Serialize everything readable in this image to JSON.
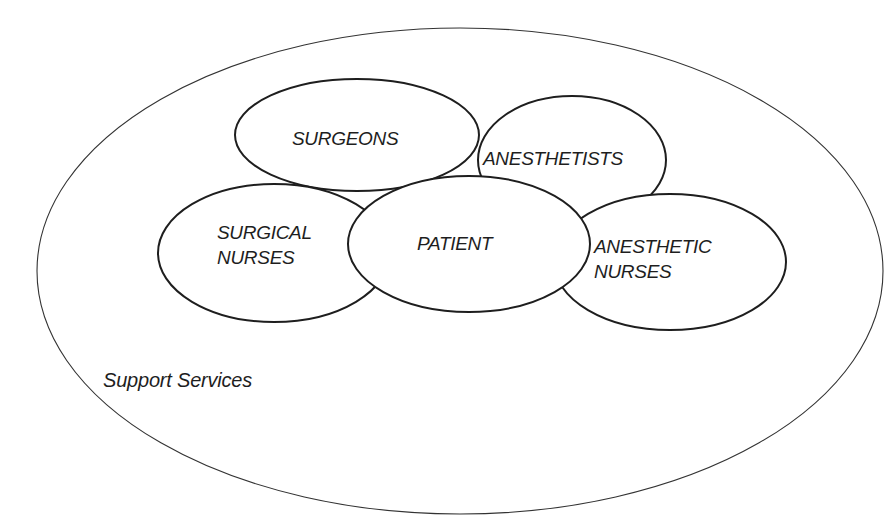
{
  "diagram": {
    "type": "nested-overlapping-ellipses",
    "outer": {
      "label": "Support Services",
      "cx": 460,
      "cy": 271,
      "rx": 423,
      "ry": 243
    },
    "nodes": [
      {
        "id": "surgeons",
        "lines": [
          "SURGEONS"
        ],
        "cx": 357,
        "cy": 135,
        "rx": 122,
        "ry": 56
      },
      {
        "id": "anesthetists",
        "lines": [
          "ANESTHETISTS"
        ],
        "cx": 572,
        "cy": 160,
        "rx": 94,
        "ry": 64
      },
      {
        "id": "surgical-nurses",
        "lines": [
          "SURGICAL",
          "NURSES"
        ],
        "cx": 274,
        "cy": 253,
        "rx": 116,
        "ry": 69
      },
      {
        "id": "anesthetic-nurses",
        "lines": [
          "ANESTHETIC",
          "NURSES"
        ],
        "cx": 670,
        "cy": 262,
        "rx": 116,
        "ry": 68
      },
      {
        "id": "patient",
        "lines": [
          "PATIENT"
        ],
        "cx": 469,
        "cy": 244,
        "rx": 121,
        "ry": 68
      }
    ],
    "colors": {
      "stroke": "#1e1e1e",
      "fill": "#ffffff",
      "background": "#ffffff"
    }
  }
}
